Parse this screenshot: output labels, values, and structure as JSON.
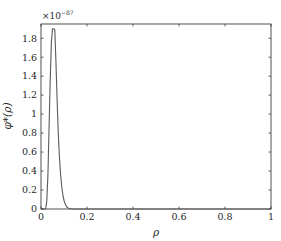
{
  "chart_data": {
    "type": "line",
    "title": "",
    "xlabel": "ρ",
    "ylabel": "φ*(ρ)",
    "y_multiplier": "×10⁻⁸⁷",
    "xlim": [
      0,
      1
    ],
    "ylim": [
      0,
      1.95
    ],
    "grid": false,
    "legend": null,
    "x_ticks": [
      0,
      0.2,
      0.4,
      0.6,
      0.8,
      1
    ],
    "x_tick_labels": [
      "0",
      "0.2",
      "0.4",
      "0.6",
      "0.8",
      "1"
    ],
    "y_ticks": [
      0,
      0.2,
      0.4,
      0.6,
      0.8,
      1,
      1.2,
      1.4,
      1.6,
      1.8
    ],
    "y_tick_labels": [
      "0",
      "0.2",
      "0.4",
      "0.6",
      "0.8",
      "1",
      "1.2",
      "1.4",
      "1.6",
      "1.8"
    ],
    "series": [
      {
        "name": "φ*(ρ)",
        "color": "#5a5a5a",
        "x": [
          0,
          0.02,
          0.025,
          0.03,
          0.035,
          0.04,
          0.045,
          0.05,
          0.055,
          0.06,
          0.065,
          0.07,
          0.075,
          0.08,
          0.085,
          0.09,
          0.095,
          0.1,
          0.105,
          0.11,
          0.115,
          0.12,
          0.13,
          0.14,
          0.15,
          1
        ],
        "values": [
          0,
          0,
          0.08,
          0.35,
          0.85,
          1.35,
          1.75,
          1.9,
          1.9,
          1.89,
          1.55,
          1.15,
          0.8,
          0.55,
          0.37,
          0.24,
          0.15,
          0.09,
          0.055,
          0.03,
          0.015,
          0.008,
          0.002,
          0,
          0,
          0
        ]
      }
    ]
  }
}
